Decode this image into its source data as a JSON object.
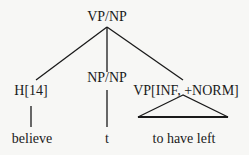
{
  "tree": {
    "root": {
      "label": "VP/NP"
    },
    "children": [
      {
        "label": "H[14]",
        "leaf": "believe",
        "edge": "line"
      },
      {
        "label": "NP/NP",
        "leaf": "t",
        "edge": "line"
      },
      {
        "label": "VP[INF, +NORM]",
        "leaf": "to have left",
        "edge": "triangle"
      }
    ]
  },
  "colors": {
    "line": "#1a1a1a",
    "background": "#f7f7f5"
  }
}
